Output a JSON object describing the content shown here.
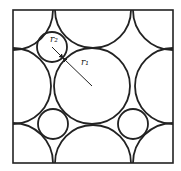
{
  "diagram": {
    "type": "circle-packing-square-lattice",
    "frame": {
      "x": 13,
      "y": 10,
      "width": 160,
      "height": 153
    },
    "stroke_color": "#222222",
    "large_circles": [
      {
        "cx": 13,
        "cy": 10,
        "r": 40
      },
      {
        "cx": 93,
        "cy": 10,
        "r": 38
      },
      {
        "cx": 173,
        "cy": 10,
        "r": 40
      },
      {
        "cx": 13,
        "cy": 86,
        "r": 38
      },
      {
        "cx": 92,
        "cy": 86,
        "r": 38
      },
      {
        "cx": 173,
        "cy": 86,
        "r": 38
      },
      {
        "cx": 13,
        "cy": 163,
        "r": 40
      },
      {
        "cx": 93,
        "cy": 163,
        "r": 38
      },
      {
        "cx": 173,
        "cy": 163,
        "r": 40
      }
    ],
    "small_circles": [
      {
        "cx": 52,
        "cy": 47,
        "r": 15
      },
      {
        "cx": 53,
        "cy": 124,
        "r": 15
      },
      {
        "cx": 133,
        "cy": 124,
        "r": 15
      }
    ],
    "labels": {
      "small_radius": "r₂",
      "large_radius": "r₁"
    },
    "radius_arrow": {
      "x1": 52,
      "y1": 47,
      "x2": 92,
      "y2": 86,
      "tangent_x": 63,
      "tangent_y": 58
    }
  }
}
